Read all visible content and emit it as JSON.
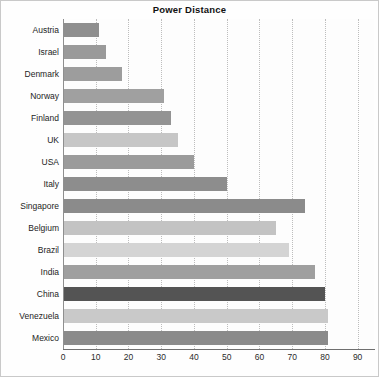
{
  "chart_data": {
    "type": "bar",
    "orientation": "horizontal",
    "title": "Power Distance",
    "xlabel": "",
    "ylabel": "",
    "xlim": [
      0,
      95
    ],
    "xticks": [
      0,
      10,
      20,
      30,
      40,
      50,
      60,
      70,
      80,
      90
    ],
    "grid": true,
    "legend": "none",
    "categories": [
      "Austria",
      "Israel",
      "Denmark",
      "Norway",
      "Finland",
      "UK",
      "USA",
      "Italy",
      "Singapore",
      "Belgium",
      "Brazil",
      "India",
      "China",
      "Venezuela",
      "Mexico"
    ],
    "values": [
      11,
      13,
      18,
      31,
      33,
      35,
      40,
      50,
      74,
      65,
      69,
      77,
      80,
      81,
      81
    ],
    "bar_colors": [
      "#8f8f8f",
      "#9a9a9a",
      "#9d9d9d",
      "#a0a0a0",
      "#939393",
      "#c6c6c6",
      "#9b9b9b",
      "#8d8d8d",
      "#8b8b8b",
      "#c3c3c3",
      "#d4d4d4",
      "#9f9f9f",
      "#545454",
      "#c9c9c9",
      "#8a8a8a"
    ]
  },
  "colors": {
    "background": "#fefefe",
    "plot_background": "#fdfdfd",
    "gridline": "#bdbdbd",
    "axis": "#6f6f6f",
    "text": "#1d1d1d",
    "border": "#c9c9c9"
  }
}
